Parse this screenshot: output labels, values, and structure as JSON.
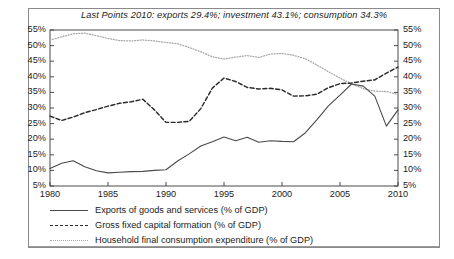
{
  "chart_data": {
    "type": "line",
    "title": "Last Points 2010: exports 29.4%; investment 43.1%; consumption 34.3%",
    "xlabel": "",
    "ylabel": "",
    "xlim": [
      1980,
      2010
    ],
    "ylim": [
      5,
      55
    ],
    "grid": false,
    "legend_position": "below",
    "y_tick_labels": [
      "55%",
      "50%",
      "45%",
      "40%",
      "35%",
      "30%",
      "25%",
      "20%",
      "15%",
      "10%",
      "5%"
    ],
    "y_ticks": [
      55,
      50,
      45,
      40,
      35,
      30,
      25,
      20,
      15,
      10,
      5
    ],
    "y_axis_right_mirrored": true,
    "x_tick_labels": [
      "1980",
      "1985",
      "1990",
      "1995",
      "2000",
      "2005",
      "2010"
    ],
    "x_ticks": [
      1980,
      1985,
      1990,
      1995,
      2000,
      2005,
      2010
    ],
    "x": [
      1980,
      1981,
      1982,
      1983,
      1984,
      1985,
      1986,
      1987,
      1988,
      1989,
      1990,
      1991,
      1992,
      1993,
      1994,
      1995,
      1996,
      1997,
      1998,
      1999,
      2000,
      2001,
      2002,
      2003,
      2004,
      2005,
      2006,
      2007,
      2008,
      2009,
      2010
    ],
    "series": [
      {
        "name": "Exports of goods and services (% of GDP)",
        "style": "solid",
        "color": "#4a4a4a",
        "last_value": 29.4,
        "values": [
          10.6,
          12.3,
          13.1,
          11.2,
          9.9,
          9.2,
          9.4,
          9.6,
          9.7,
          10.0,
          10.2,
          13.0,
          15.3,
          17.8,
          19.2,
          20.7,
          19.5,
          20.6,
          19.0,
          19.5,
          19.3,
          19.2,
          22.0,
          26.2,
          30.7,
          34.1,
          37.7,
          37.0,
          33.8,
          24.2,
          29.4
        ]
      },
      {
        "name": "Gross fixed capital formation (% of GDP)",
        "style": "dashed",
        "color": "#2a2a2a",
        "last_value": 43.1,
        "values": [
          27.4,
          26.0,
          27.1,
          28.5,
          29.5,
          30.6,
          31.5,
          32.0,
          32.8,
          29.4,
          25.4,
          25.4,
          25.7,
          29.8,
          36.4,
          39.6,
          38.5,
          36.6,
          36.1,
          36.3,
          35.8,
          33.8,
          33.9,
          34.4,
          36.5,
          37.8,
          38.0,
          38.6,
          39.0,
          41.2,
          43.1
        ]
      },
      {
        "name": "Household final consumption expenditure (% of GDP)",
        "style": "dotted",
        "color": "#a8a8a8",
        "last_value": 34.3,
        "values": [
          51.8,
          52.8,
          53.8,
          54.0,
          53.2,
          52.3,
          51.6,
          51.5,
          51.8,
          51.5,
          51.0,
          50.6,
          49.4,
          48.0,
          46.4,
          45.7,
          46.3,
          46.8,
          46.2,
          47.3,
          47.5,
          46.9,
          45.8,
          43.8,
          41.6,
          39.6,
          37.7,
          36.2,
          35.4,
          35.3,
          34.3
        ]
      }
    ]
  },
  "legend": {
    "items": [
      {
        "label": "Exports of goods and services (% of GDP)",
        "style": "solid"
      },
      {
        "label": "Gross fixed capital formation (% of GDP)",
        "style": "dashed"
      },
      {
        "label": "Household final consumption expenditure (% of GDP)",
        "style": "dotted"
      }
    ]
  }
}
